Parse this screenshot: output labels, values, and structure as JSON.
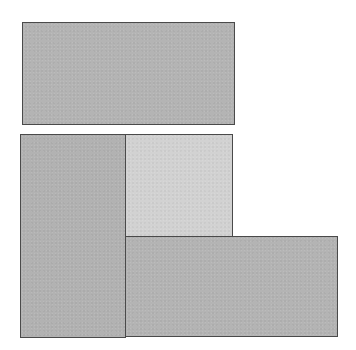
{
  "diagram": {
    "canvas": {
      "width": 356,
      "height": 350,
      "background": "#ffffff"
    },
    "shapes": [
      {
        "id": "top-rectangle",
        "x": 22,
        "y": 22,
        "w": 213,
        "h": 103,
        "fill": "#b4b4b4"
      },
      {
        "id": "left-tall-rectangle",
        "x": 20,
        "y": 134,
        "w": 106,
        "h": 204,
        "fill": "#b2b2b2"
      },
      {
        "id": "light-square",
        "x": 125,
        "y": 134,
        "w": 108,
        "h": 103,
        "fill": "#d2d2d2"
      },
      {
        "id": "bottom-right-rectangle",
        "x": 125,
        "y": 236,
        "w": 213,
        "h": 101,
        "fill": "#b4b4b4"
      }
    ],
    "border_color": "#4a4a4a"
  }
}
